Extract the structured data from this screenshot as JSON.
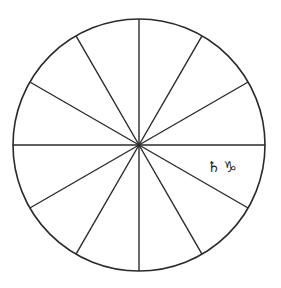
{
  "diagram": {
    "type": "astrological-house-wheel",
    "houses": 12,
    "center": {
      "x": 139,
      "y": 145
    },
    "radius": 126,
    "stroke_color": "#2a2a2a",
    "background_color": "#ffffff",
    "spoke_angles_deg": [
      0,
      30,
      60,
      90,
      120,
      150,
      180,
      210,
      240,
      270,
      300,
      330
    ]
  },
  "placements": [
    {
      "planet": "Saturn",
      "planet_glyph": "♄",
      "sign": "Capricorn",
      "sign_glyph": "♑",
      "label": "♄ ♑",
      "position": {
        "x": 207,
        "y": 160
      }
    }
  ]
}
